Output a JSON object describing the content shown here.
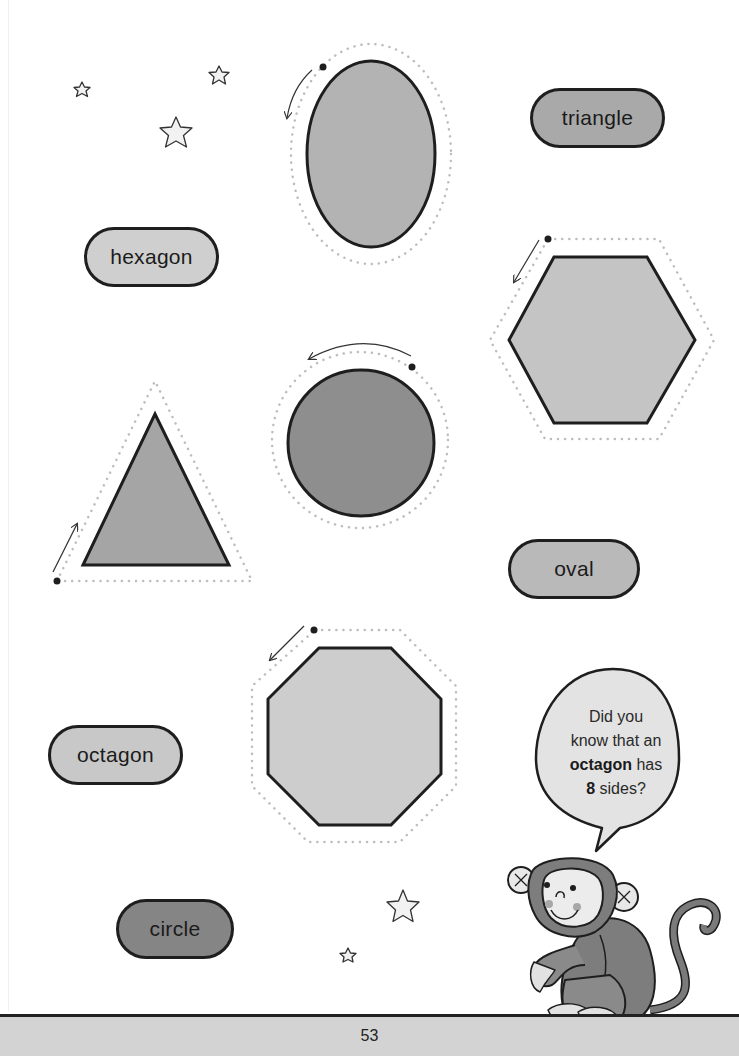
{
  "labels": {
    "triangle": {
      "text": "triangle",
      "fill": "#a9a9a9"
    },
    "hexagon": {
      "text": "hexagon",
      "fill": "#cfcfcf"
    },
    "oval": {
      "text": "oval",
      "fill": "#b9b9b9"
    },
    "octagon": {
      "text": "octagon",
      "fill": "#c8c8c8"
    },
    "circle": {
      "text": "circle",
      "fill": "#858585"
    }
  },
  "shapes": [
    {
      "name": "oval",
      "fill": "#b3b3b3",
      "trace_direction": "counter-clockwise"
    },
    {
      "name": "hexagon",
      "fill": "#c4c4c4",
      "trace_direction": "counter-clockwise"
    },
    {
      "name": "circle",
      "fill": "#8e8e8e",
      "trace_direction": "counter-clockwise"
    },
    {
      "name": "triangle",
      "fill": "#a5a5a5",
      "trace_direction": "clockwise"
    },
    {
      "name": "octagon",
      "fill": "#cdcdcd",
      "trace_direction": "counter-clockwise"
    }
  ],
  "speech_bubble": {
    "line1": "Did you",
    "line2": "know that an",
    "bold_word": "octagon",
    "line3_rest": " has",
    "bold_number": "8",
    "line4_rest": " sides?"
  },
  "decorations": {
    "stars": 5,
    "character": "monkey"
  },
  "footer": {
    "page_number": "53"
  }
}
